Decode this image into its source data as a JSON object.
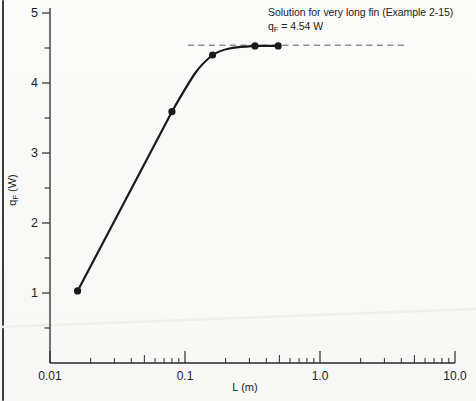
{
  "page": {
    "background": "#f8f8f6",
    "page_edge_color": "#3a3a3a"
  },
  "annotation": {
    "line1": "Solution for very long fin (Example 2-15)",
    "line2_base": "q",
    "line2_sub": "F",
    "line2_rest": " = 4.54 W"
  },
  "axes": {
    "xlabel": "L (m)",
    "ylabel_base": "q",
    "ylabel_sub": "F",
    "ylabel_rest": " (W)",
    "x_ticks": [
      {
        "value": 0.01,
        "label": "0.01"
      },
      {
        "value": 0.1,
        "label": "0.1"
      },
      {
        "value": 1,
        "label": "1.0"
      },
      {
        "value": 10,
        "label": "10.0"
      }
    ],
    "y_major_ticks": [
      {
        "value": 1,
        "label": "1"
      },
      {
        "value": 2,
        "label": "2"
      },
      {
        "value": 3,
        "label": "3"
      },
      {
        "value": 4,
        "label": "4"
      },
      {
        "value": 5,
        "label": "5"
      }
    ],
    "y_minor_ticks": [
      0.5,
      1.5,
      2.5,
      3.5,
      4.5
    ]
  },
  "chart_data": {
    "type": "line",
    "title": "",
    "xlabel": "L (m)",
    "ylabel": "qF (W)",
    "x_scale": "log",
    "xlim": [
      0.01,
      10
    ],
    "ylim": [
      0,
      5
    ],
    "grid": false,
    "x_tick_labels": [
      "0.01",
      "0.1",
      "1.0",
      "10.0"
    ],
    "y_tick_labels": [
      "1",
      "2",
      "3",
      "4",
      "5"
    ],
    "series": [
      {
        "name": "Fin heat transfer rate vs fin length",
        "marker": "circle",
        "color": "#1a1a1a",
        "points": [
          [
            0.016,
            1.03
          ],
          [
            0.08,
            3.59
          ],
          [
            0.16,
            4.4
          ],
          [
            0.33,
            4.53
          ],
          [
            0.49,
            4.53
          ]
        ]
      }
    ],
    "reference_line": {
      "style": "dashed",
      "color": "#8e8e8e",
      "value": 4.54,
      "x_start": 0.105,
      "x_end": 4.3,
      "meaning": "Solution for very long fin (Example 2-15), qF = 4.54 W"
    }
  }
}
